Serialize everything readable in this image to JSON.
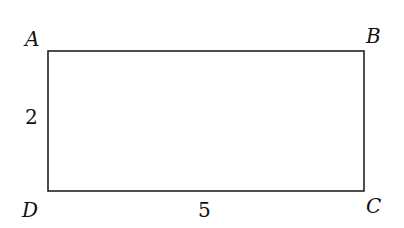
{
  "figure": {
    "shape": "rectangle",
    "vertices": {
      "A": {
        "label": "A"
      },
      "B": {
        "label": "B"
      },
      "C": {
        "label": "C"
      },
      "D": {
        "label": "D"
      }
    },
    "side_labels": {
      "AD": "2",
      "DC": "5"
    },
    "stroke_color": "#222222"
  }
}
